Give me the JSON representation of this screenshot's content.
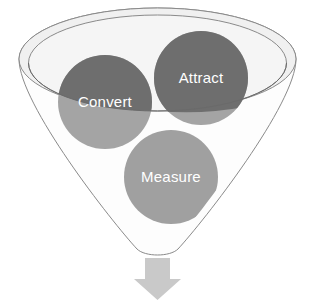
{
  "diagram": {
    "type": "funnel-diagram",
    "background_color": "#ffffff",
    "funnel": {
      "name": "funnel-shape",
      "wall_fill": "#fdfdfd",
      "rim_band_fill": "#f1f1f1",
      "inner_basin_fill": "#f4f4f4",
      "outline_color": "#808080",
      "outline_width": 1
    },
    "stages": [
      {
        "id": "attract",
        "label": "Attract",
        "color": "#6e6e6e",
        "submerged_color": "#a4a4a4",
        "text_color": "#ffffff",
        "cx": 201,
        "cy": 78,
        "r": 47
      },
      {
        "id": "convert",
        "label": "Convert",
        "color": "#6e6e6e",
        "submerged_color": "#a4a4a4",
        "text_color": "#ffffff",
        "cx": 105,
        "cy": 102,
        "r": 47
      },
      {
        "id": "measure",
        "label": "Measure",
        "color": "#a0a0a0",
        "submerged_color": "#a0a0a0",
        "text_color": "#ffffff",
        "cx": 171,
        "cy": 177,
        "r": 47
      }
    ],
    "arrow": {
      "name": "down-arrow",
      "color": "#c9c9c9",
      "direction": "down"
    }
  }
}
